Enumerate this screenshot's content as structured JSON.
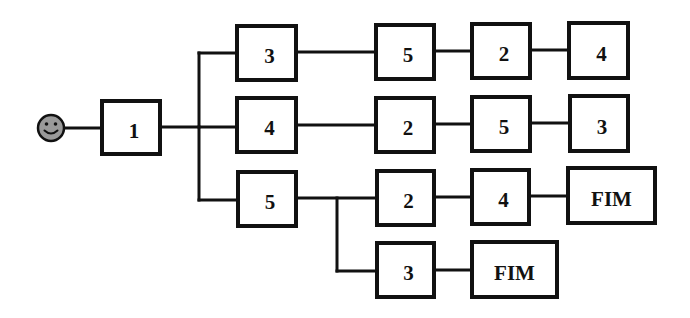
{
  "diagram": {
    "type": "sequence-tree",
    "start": {
      "icon": "smiley-face-icon",
      "cx": 51,
      "cy": 128,
      "r": 13,
      "color": "#9a9a9a"
    },
    "nodes": [
      {
        "id": "n1",
        "label": "1",
        "x": 102,
        "y": 101,
        "w": 58,
        "h": 53
      },
      {
        "id": "n2",
        "label": "3",
        "x": 237,
        "y": 26,
        "w": 59,
        "h": 54
      },
      {
        "id": "n3",
        "label": "4",
        "x": 237,
        "y": 98,
        "w": 59,
        "h": 54
      },
      {
        "id": "n4",
        "label": "5",
        "x": 238,
        "y": 172,
        "w": 58,
        "h": 54
      },
      {
        "id": "n5",
        "label": "5",
        "x": 376,
        "y": 25,
        "w": 58,
        "h": 54
      },
      {
        "id": "n6",
        "label": "2",
        "x": 376,
        "y": 98,
        "w": 58,
        "h": 54
      },
      {
        "id": "n7",
        "label": "2",
        "x": 377,
        "y": 171,
        "w": 57,
        "h": 54
      },
      {
        "id": "n8",
        "label": "3",
        "x": 377,
        "y": 243,
        "w": 57,
        "h": 54
      },
      {
        "id": "n9",
        "label": "2",
        "x": 472,
        "y": 24,
        "w": 58,
        "h": 54
      },
      {
        "id": "n10",
        "label": "5",
        "x": 472,
        "y": 97,
        "w": 58,
        "h": 54
      },
      {
        "id": "n11",
        "label": "4",
        "x": 472,
        "y": 170,
        "w": 57,
        "h": 54
      },
      {
        "id": "n12",
        "label": "FIM",
        "x": 472,
        "y": 242,
        "w": 85,
        "h": 55
      },
      {
        "id": "n13",
        "label": "4",
        "x": 569,
        "y": 23,
        "w": 59,
        "h": 55
      },
      {
        "id": "n14",
        "label": "3",
        "x": 570,
        "y": 96,
        "w": 58,
        "h": 55
      },
      {
        "id": "n15",
        "label": "FIM",
        "x": 568,
        "y": 168,
        "w": 87,
        "h": 55
      }
    ],
    "edges": [
      {
        "from": "start",
        "to": "n1"
      },
      {
        "from": "n1",
        "to": "n2"
      },
      {
        "from": "n1",
        "to": "n3"
      },
      {
        "from": "n1",
        "to": "n4"
      },
      {
        "from": "n2",
        "to": "n5"
      },
      {
        "from": "n5",
        "to": "n9"
      },
      {
        "from": "n9",
        "to": "n13"
      },
      {
        "from": "n3",
        "to": "n6"
      },
      {
        "from": "n6",
        "to": "n10"
      },
      {
        "from": "n10",
        "to": "n14"
      },
      {
        "from": "n4",
        "to": "n7"
      },
      {
        "from": "n4",
        "to": "n8"
      },
      {
        "from": "n7",
        "to": "n11"
      },
      {
        "from": "n11",
        "to": "n15"
      },
      {
        "from": "n8",
        "to": "n12"
      }
    ],
    "paths": [
      [
        "1",
        "3",
        "5",
        "2",
        "4"
      ],
      [
        "1",
        "4",
        "2",
        "5",
        "3"
      ],
      [
        "1",
        "5",
        "2",
        "4",
        "FIM"
      ],
      [
        "1",
        "5",
        "3",
        "FIM"
      ]
    ]
  }
}
